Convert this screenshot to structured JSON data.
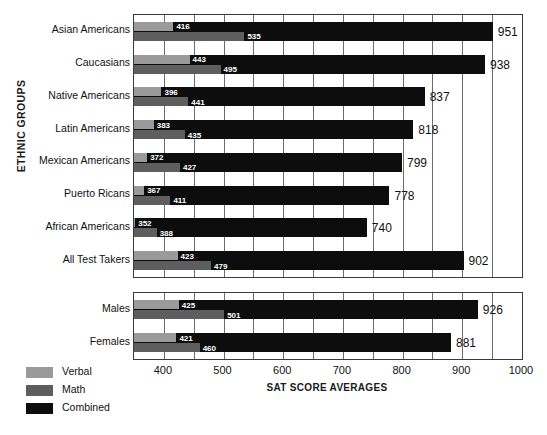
{
  "chart_data": {
    "type": "bar",
    "orientation": "horizontal",
    "title": "",
    "xlabel": "SAT SCORE AVERAGES",
    "ylabel": "ETHNIC GROUPS",
    "xlim": [
      350,
      1000
    ],
    "xticks": [
      400,
      500,
      600,
      700,
      800,
      900,
      1000
    ],
    "xtick_labels": [
      "400",
      "500",
      "600",
      "700",
      "800",
      "900",
      "1000"
    ],
    "gridline_step": 50,
    "grid": true,
    "legend_position": "bottom-left",
    "series": [
      {
        "name": "Verbal",
        "color": "#9a9a9a"
      },
      {
        "name": "Math",
        "color": "#5e5e5e"
      },
      {
        "name": "Combined",
        "color": "#0d0d0d"
      }
    ],
    "panels": [
      {
        "id": "ethnic-groups",
        "axis_label": "ETHNIC GROUPS",
        "categories": [
          "Asian Americans",
          "Caucasians",
          "Native Americans",
          "Latin Americans",
          "Mexican Americans",
          "Puerto Ricans",
          "African Americans",
          "All Test Takers"
        ],
        "verbal": [
          416,
          443,
          396,
          383,
          372,
          367,
          352,
          423
        ],
        "math": [
          535,
          495,
          441,
          435,
          427,
          411,
          388,
          479
        ],
        "combined": [
          951,
          938,
          837,
          818,
          799,
          778,
          740,
          902
        ]
      },
      {
        "id": "gender",
        "axis_label": "",
        "categories": [
          "Males",
          "Females"
        ],
        "verbal": [
          425,
          421
        ],
        "math": [
          501,
          460
        ],
        "combined": [
          926,
          881
        ]
      }
    ]
  },
  "legend": {
    "items": [
      {
        "label": "Verbal",
        "color": "#9a9a9a"
      },
      {
        "label": "Math",
        "color": "#5e5e5e"
      },
      {
        "label": "Combined",
        "color": "#0d0d0d"
      }
    ]
  },
  "axis": {
    "y_title": "ETHNIC GROUPS",
    "x_title": "SAT SCORE AVERAGES"
  },
  "caption": ""
}
